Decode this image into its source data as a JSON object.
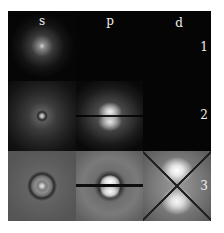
{
  "figure": {
    "columns": [
      {
        "label": "s"
      },
      {
        "label": "p"
      },
      {
        "label": "d"
      }
    ],
    "rows": [
      {
        "label": "1"
      },
      {
        "label": "2"
      },
      {
        "label": "3"
      }
    ],
    "cells": [
      {
        "row": "1",
        "col": "s",
        "content": "central glow"
      },
      {
        "row": "1",
        "col": "p",
        "content": "empty"
      },
      {
        "row": "1",
        "col": "d",
        "content": "empty"
      },
      {
        "row": "2",
        "col": "s",
        "content": "bright center with faint halo"
      },
      {
        "row": "2",
        "col": "p",
        "content": "two lobes separated by horizontal node"
      },
      {
        "row": "2",
        "col": "d",
        "content": "empty"
      },
      {
        "row": "3",
        "col": "s",
        "content": "central point with dark ring node"
      },
      {
        "row": "3",
        "col": "p",
        "content": "two lobes with horizontal node and ring"
      },
      {
        "row": "3",
        "col": "d",
        "content": "four-lobed pattern with X-shaped nodes"
      }
    ],
    "colors": {
      "background_dark": "#050505",
      "row3_background": "#5e5e5e",
      "label": "#f0f0f0"
    }
  }
}
